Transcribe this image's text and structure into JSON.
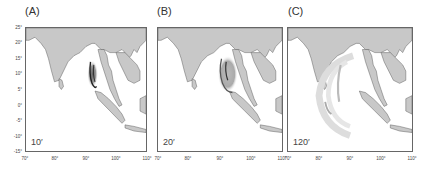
{
  "figure": {
    "extent": {
      "lon_min": 70,
      "lon_max": 110,
      "lat_min": -15,
      "lat_max": 25
    },
    "yticks": [
      "25°",
      "20°",
      "15°",
      "10°",
      "5°",
      "0°",
      "-5°",
      "-10°",
      "-15°"
    ],
    "xticks": [
      "70°",
      "80°",
      "90°",
      "100°",
      "110°"
    ],
    "colors": {
      "land": "#c8c8c8",
      "ocean": "#ffffff",
      "frame": "#666666",
      "wave": "#333333"
    },
    "panels": [
      {
        "label": "(A)",
        "time": "10′"
      },
      {
        "label": "(B)",
        "time": "20′"
      },
      {
        "label": "(C)",
        "time": "120′"
      }
    ]
  }
}
